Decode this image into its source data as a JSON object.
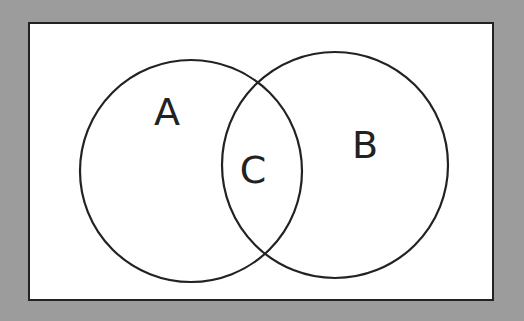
{
  "diagram": {
    "type": "venn",
    "background_color": "#9c9c9c",
    "panel_color": "#ffffff",
    "stroke_color": "#222222",
    "sets": [
      {
        "id": "A",
        "label": "A",
        "cx": 191,
        "cy": 171,
        "r": 111,
        "label_x": 167,
        "label_y": 125
      },
      {
        "id": "B",
        "label": "B",
        "cx": 335,
        "cy": 165,
        "r": 113,
        "label_x": 365,
        "label_y": 158
      }
    ],
    "intersection": {
      "label": "C",
      "label_x": 253,
      "label_y": 183
    }
  }
}
